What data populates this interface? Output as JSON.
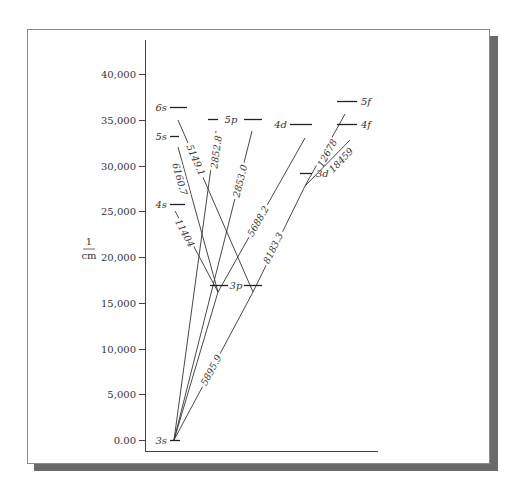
{
  "figure": {
    "y_axis_unit_numerator": "1",
    "y_axis_unit_denominator": "cm",
    "y_ticks": [
      {
        "label": "40,000",
        "value": 40000
      },
      {
        "label": "35,000",
        "value": 35000
      },
      {
        "label": "30,000",
        "value": 30000
      },
      {
        "label": "25,000",
        "value": 25000
      },
      {
        "label": "20,000",
        "value": 20000
      },
      {
        "label": "15,000",
        "value": 15000
      },
      {
        "label": "10,000",
        "value": 10000
      },
      {
        "label": "5,000",
        "value": 5000
      },
      {
        "label": "0.00",
        "value": 0
      }
    ],
    "levels": [
      {
        "id": "3s",
        "label": "3s",
        "italic": false,
        "energy": 0,
        "segments": [
          [
            170,
            180
          ]
        ],
        "label_side": "left"
      },
      {
        "id": "4s",
        "label": "4s",
        "italic": true,
        "energy": 25740,
        "segments": [
          [
            170,
            185
          ]
        ],
        "label_side": "left"
      },
      {
        "id": "5s",
        "label": "5s",
        "italic": true,
        "energy": 33200,
        "segments": [
          [
            170,
            179
          ]
        ],
        "label_side": "left"
      },
      {
        "id": "6s",
        "label": "6s",
        "italic": true,
        "energy": 36375,
        "segments": [
          [
            170,
            187
          ]
        ],
        "label_side": "left"
      },
      {
        "id": "3p",
        "label": "3p",
        "italic": true,
        "energy": 16960,
        "segments": [
          [
            210,
            228
          ],
          [
            244,
            262
          ]
        ],
        "label_side": "between"
      },
      {
        "id": "5p",
        "label": "5p",
        "italic": true,
        "energy": 35040,
        "segments": [
          [
            208,
            218
          ],
          [
            244,
            262
          ]
        ],
        "label_side": "between"
      },
      {
        "id": "4d",
        "label": "4d",
        "italic": true,
        "energy": 34550,
        "segments": [
          [
            290,
            312
          ]
        ],
        "label_side": "left"
      },
      {
        "id": "3d",
        "label": "3d",
        "italic": true,
        "energy": 29170,
        "segments": [
          [
            300,
            312
          ]
        ],
        "label_side": "right"
      },
      {
        "id": "5f",
        "label": "5f",
        "italic": true,
        "energy": 37050,
        "segments": [
          [
            337,
            357
          ]
        ],
        "label_side": "right"
      },
      {
        "id": "4f",
        "label": "4f",
        "italic": true,
        "energy": 34590,
        "segments": [
          [
            337,
            357
          ]
        ],
        "label_side": "right"
      }
    ],
    "transitions": [
      {
        "from": "6s",
        "to": "3p",
        "label": "5149.1",
        "x1": 178,
        "y1": 120,
        "x2": 253,
        "y2": 292,
        "lx": 196,
        "ly": 160
      },
      {
        "from": "5s",
        "to": "3p",
        "label": "6160.7",
        "x1": 178,
        "y1": 147,
        "x2": 218,
        "y2": 292,
        "lx": 180,
        "ly": 179
      },
      {
        "from": "4s",
        "to": "3p",
        "label": "11404",
        "x1": 175,
        "y1": 211,
        "x2": 218,
        "y2": 292,
        "lx": 185,
        "ly": 233
      },
      {
        "from": "5p",
        "to": "3s",
        "label": "2852.8",
        "x1": 216,
        "y1": 131,
        "x2": 174,
        "y2": 440,
        "lx": 216,
        "ly": 152
      },
      {
        "from": "5p",
        "to": "3s",
        "label": "2853.0",
        "x1": 252,
        "y1": 131,
        "x2": 174,
        "y2": 440,
        "lx": 240,
        "ly": 181
      },
      {
        "from": "4d",
        "to": "3p",
        "label": "5688.2",
        "x1": 305,
        "y1": 138,
        "x2": 218,
        "y2": 292,
        "lx": 258,
        "ly": 221
      },
      {
        "from": "4d",
        "to": "3s",
        "label": "",
        "x1": 218,
        "y1": 292,
        "x2": 174,
        "y2": 440,
        "lx": 0,
        "ly": 0
      },
      {
        "from": "3d",
        "to": "3p",
        "label": "8183.3",
        "x1": 305,
        "y1": 186,
        "x2": 253,
        "y2": 292,
        "lx": 273,
        "ly": 248
      },
      {
        "from": "3p",
        "to": "3s",
        "label": "5895.9",
        "x1": 253,
        "y1": 292,
        "x2": 174,
        "y2": 440,
        "lx": 211,
        "ly": 370
      },
      {
        "from": "5f",
        "to": "3d",
        "label": "12678",
        "x1": 345,
        "y1": 114,
        "x2": 305,
        "y2": 186,
        "lx": 327,
        "ly": 153
      },
      {
        "from": "4f",
        "to": "3d",
        "label": "18459",
        "x1": 350,
        "y1": 140,
        "x2": 305,
        "y2": 186,
        "lx": 341,
        "ly": 160
      }
    ]
  }
}
